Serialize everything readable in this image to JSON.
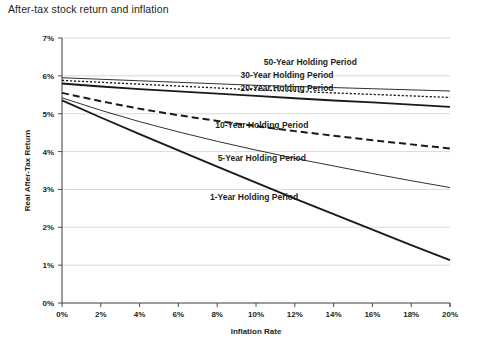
{
  "title": "After-tax stock return and inflation",
  "chart_data": {
    "type": "line",
    "title": "After-tax stock return and inflation",
    "xlabel": "Inflation Rate",
    "ylabel": "Real After-Tax Return",
    "xlim": [
      0,
      20
    ],
    "ylim": [
      0,
      7
    ],
    "xticks": [
      "0%",
      "2%",
      "4%",
      "6%",
      "8%",
      "10%",
      "12%",
      "14%",
      "16%",
      "18%",
      "20%"
    ],
    "yticks": [
      "0%",
      "1%",
      "2%",
      "3%",
      "4%",
      "5%",
      "6%",
      "7%"
    ],
    "xtick_values": [
      0,
      2,
      4,
      6,
      8,
      10,
      12,
      14,
      16,
      18,
      20
    ],
    "ytick_values": [
      0,
      1,
      2,
      3,
      4,
      5,
      6,
      7
    ],
    "grid": "horizontal",
    "legend_position": "inline-labels",
    "x": [
      0,
      2,
      4,
      6,
      8,
      10,
      12,
      14,
      16,
      18,
      20
    ],
    "series": [
      {
        "name": "50-Year Holding Period",
        "style": "thin-solid",
        "stroke_width": 0.9,
        "dash": "none",
        "values": [
          5.95,
          5.91,
          5.87,
          5.83,
          5.79,
          5.75,
          5.72,
          5.69,
          5.66,
          5.63,
          5.6
        ],
        "label": "50-Year Holding Period",
        "label_x": 12.8,
        "label_y": 6.28
      },
      {
        "name": "30-Year Holding Period",
        "style": "dotted",
        "stroke_width": 1.3,
        "dash": "2.2 1.8",
        "values": [
          5.88,
          5.83,
          5.78,
          5.73,
          5.68,
          5.63,
          5.59,
          5.55,
          5.51,
          5.47,
          5.43
        ],
        "label": "30-Year Holding Period",
        "label_x": 11.6,
        "label_y": 5.95
      },
      {
        "name": "20-Year Holding Period",
        "style": "thick-solid",
        "stroke_width": 1.9,
        "dash": "none",
        "values": [
          5.8,
          5.72,
          5.65,
          5.59,
          5.53,
          5.47,
          5.41,
          5.35,
          5.3,
          5.24,
          5.18
        ],
        "label": "20-Year Holding Period",
        "label_x": 11.6,
        "label_y": 5.6
      },
      {
        "name": "10-Year Holding Period",
        "style": "long-dash",
        "stroke_width": 2.0,
        "dash": "7 4",
        "values": [
          5.55,
          5.33,
          5.13,
          4.96,
          4.81,
          4.67,
          4.54,
          4.42,
          4.3,
          4.19,
          4.08
        ],
        "label": "10-Year Holding Period",
        "label_x": 10.3,
        "label_y": 4.62
      },
      {
        "name": "5-Year Holding Period",
        "style": "thin-solid",
        "stroke_width": 0.9,
        "dash": "none",
        "values": [
          5.42,
          5.09,
          4.79,
          4.52,
          4.27,
          4.04,
          3.82,
          3.62,
          3.42,
          3.23,
          3.05
        ],
        "label": "5-Year Holding Period",
        "label_x": 10.3,
        "label_y": 3.74
      },
      {
        "name": "1-Year Holding Period",
        "style": "thick-solid",
        "stroke_width": 1.9,
        "dash": "none",
        "values": [
          5.35,
          4.9,
          4.46,
          4.03,
          3.6,
          3.18,
          2.76,
          2.35,
          1.94,
          1.53,
          1.13
        ],
        "label": "1-Year Holding Period",
        "label_x": 9.9,
        "label_y": 2.72
      }
    ]
  }
}
